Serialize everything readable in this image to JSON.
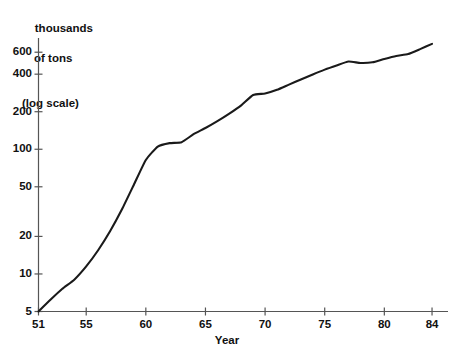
{
  "chart_data": {
    "type": "line",
    "title": "",
    "ylabel": "thousands of tons (log scale)",
    "ylabel_lines": [
      "thousands",
      "of tons",
      "(log scale)"
    ],
    "xlabel": "Year",
    "xlim": [
      51,
      84.5
    ],
    "ylim": [
      5,
      780
    ],
    "yscale": "log",
    "grid": false,
    "legend": null,
    "line_color": "#1a1a1a",
    "x": [
      51,
      52,
      53,
      54,
      55,
      56,
      57,
      58,
      59,
      60,
      61,
      62,
      63,
      64,
      65,
      66,
      67,
      68,
      69,
      70,
      71,
      72,
      73,
      74,
      75,
      76,
      77,
      78,
      79,
      80,
      81,
      82,
      83,
      84
    ],
    "values": [
      5.0,
      6.2,
      7.6,
      9.0,
      11.5,
      15.5,
      22.0,
      33.0,
      52.0,
      82.0,
      105.0,
      112.0,
      114.0,
      132.0,
      148.0,
      168.0,
      193.0,
      225.0,
      272.0,
      280.0,
      300.0,
      330.0,
      362.0,
      398.0,
      435.0,
      470.0,
      505.0,
      492.0,
      498.0,
      530.0,
      560.0,
      580.0,
      635.0,
      700.0
    ],
    "yticks": [
      5,
      10,
      20,
      50,
      100,
      200,
      400,
      600
    ],
    "ytick_labels": [
      "5",
      "10",
      "20",
      "50",
      "100",
      "200",
      "400",
      "600"
    ],
    "xticks": [
      51,
      55,
      60,
      65,
      70,
      75,
      80,
      84
    ],
    "xtick_labels": [
      "51",
      "55",
      "60",
      "65",
      "70",
      "75",
      "80",
      "84"
    ]
  }
}
